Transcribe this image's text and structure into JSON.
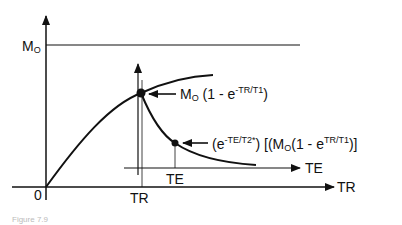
{
  "diagram": {
    "type": "mri-signal-recovery-decay",
    "main_axes": {
      "x_label": "TR",
      "origin_label": "0",
      "y_max_label": {
        "main": "M",
        "sub": "O"
      }
    },
    "tr_marker_label": "TR",
    "inner_axes": {
      "x_label": "TE",
      "te_marker_label": "TE"
    },
    "annotations": {
      "recovery": {
        "m": "M",
        "m_sub": "O",
        "prefix": " (1 - e",
        "exponent": "-TR/T1",
        "suffix": ")"
      },
      "decay": {
        "open": "(e",
        "exp1": "-TE/T2*",
        "mid": ") [(M",
        "m_sub": "O",
        "mid2": "(1 - e",
        "exp2": "TR/T1",
        "close": ")]"
      }
    },
    "caption": "Figure 7.9"
  },
  "colors": {
    "line": "#111111",
    "background": "#ffffff"
  }
}
